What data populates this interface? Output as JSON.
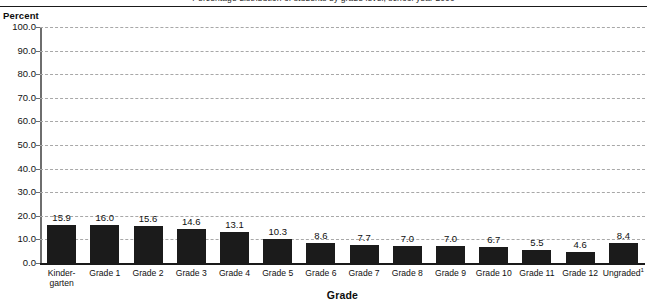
{
  "header": {
    "cutoff_text": "Percentage distribution of students by grade level, school year 2000"
  },
  "chart_data": {
    "type": "bar",
    "title": "",
    "axis_unit_label": "Percent",
    "xlabel": "Grade",
    "ylabel": "",
    "ylim": [
      0.0,
      100.0
    ],
    "ytick_step": 10.0,
    "grid": true,
    "legend": "none",
    "bar_color": "#1b1b1b",
    "categories": [
      "Kinder-garten",
      "Grade 1",
      "Grade 2",
      "Grade 3",
      "Grade 4",
      "Grade 5",
      "Grade 6",
      "Grade 7",
      "Grade 8",
      "Grade 9",
      "Grade 10",
      "Grade 11",
      "Grade 12",
      "Ungraded"
    ],
    "category_lines": [
      [
        "Kinder-",
        "garten"
      ],
      [
        "Grade 1"
      ],
      [
        "Grade 2"
      ],
      [
        "Grade 3"
      ],
      [
        "Grade 4"
      ],
      [
        "Grade 5"
      ],
      [
        "Grade 6"
      ],
      [
        "Grade 7"
      ],
      [
        "Grade 8"
      ],
      [
        "Grade 9"
      ],
      [
        "Grade 10"
      ],
      [
        "Grade 11"
      ],
      [
        "Grade 12"
      ],
      [
        "Ungraded"
      ]
    ],
    "category_superscripts": [
      "",
      "",
      "",
      "",
      "",
      "",
      "",
      "",
      "",
      "",
      "",
      "",
      "",
      "1"
    ],
    "values": [
      15.9,
      16.0,
      15.6,
      14.6,
      13.1,
      10.3,
      8.6,
      7.7,
      7.0,
      7.0,
      6.7,
      5.5,
      4.6,
      8.4
    ],
    "value_labels": [
      "15.9",
      "16.0",
      "15.6",
      "14.6",
      "13.1",
      "10.3",
      "8.6",
      "7.7",
      "7.0",
      "7.0",
      "6.7",
      "5.5",
      "4.6",
      "8.4"
    ],
    "ytick_labels": [
      "100.0",
      "90.0",
      "80.0",
      "70.0",
      "60.0",
      "50.0",
      "40.0",
      "30.0",
      "20.0",
      "10.0",
      "0.0"
    ],
    "ytick_values": [
      100.0,
      90.0,
      80.0,
      70.0,
      60.0,
      50.0,
      40.0,
      30.0,
      20.0,
      10.0,
      0.0
    ]
  }
}
